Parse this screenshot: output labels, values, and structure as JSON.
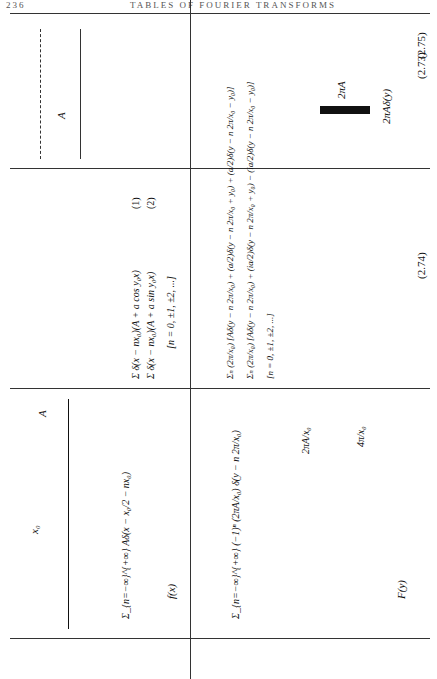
{
  "header": {
    "page_number": "236",
    "title": "TABLES OF FOURIER TRANSFORMS"
  },
  "columns": {
    "left": "f(x)",
    "right": "F(y)"
  },
  "rows": [
    {
      "number": "(2.73)",
      "f_formula": "Σ_{n=−∞}^{+∞} Aδ(x − x₀/2 − nx₀)",
      "f_labels": {
        "amplitude": "A",
        "spacing": "x₀"
      },
      "F_formula": "Σ_{n=−∞}^{+∞} (−1)ⁿ (2πA/x₀) δ(y − n 2π/x₀)",
      "F_labels": {
        "amplitude": "2πA/x₀",
        "spacing": "4π/x₀"
      }
    },
    {
      "number": "(2.74)",
      "f_formula_1": "Σ δ(x − nx₀)(A + a cos y₀x)",
      "f_formula_1_tag": "(1)",
      "f_formula_2": "Σ δ(x − nx₀)(A + a sin y₀x)",
      "f_formula_2_tag": "(2)",
      "f_range": "[n = 0, ±1, ±2, ...]",
      "f_labels": {
        "amplitude": "A",
        "modulation": "2a",
        "period": "2π/y₀",
        "spacing": "x₀"
      },
      "F_formula_1": "Σₙ (2π/x₀) [Aδ(y − n 2π/x₀) + (a/2)δ(y − n 2π/x₀ + y₀) + (a/2)δ(y − n 2π/x₀ − y₀)]",
      "F_formula_1_tag": "(1)",
      "F_formula_2": "Σₙ (2π/x₀) [Aδ(y − n 2π/x₀) + (ia/2)δ(y − n 2π/x₀ + y₀) − (ia/2)δ(y − n 2π/x₀ − y₀)]",
      "F_formula_2_tag": "(2)",
      "F_range": "[n = 0, ±1, ±2, ...]",
      "F_labels": {
        "amplitude": "2πA/x₀",
        "side": "πa/x₀",
        "spacing": "2π/x₀",
        "offset": "y₀",
        "tag1": "(1)",
        "tag2": "(2)"
      }
    },
    {
      "number": "(2.75)",
      "f_labels": {
        "amplitude": "A",
        "axis": "A"
      },
      "F_formula": "2πAδ(y)",
      "F_labels": {
        "amplitude": "2πA"
      }
    }
  ]
}
